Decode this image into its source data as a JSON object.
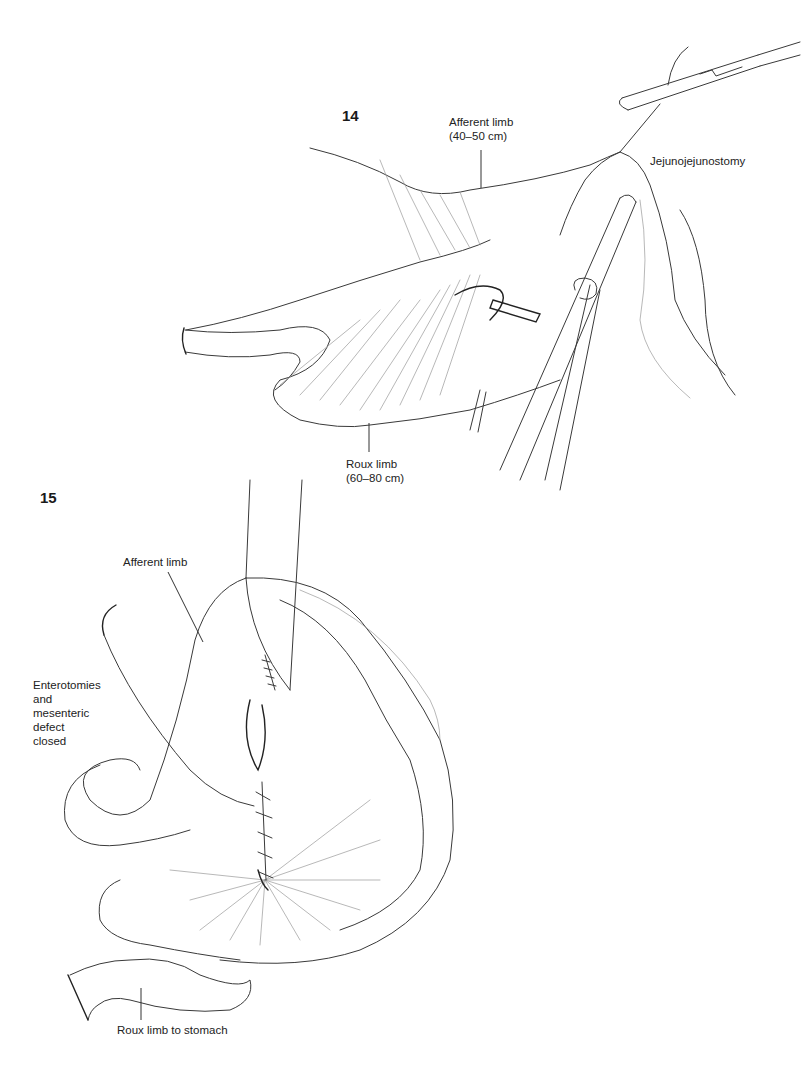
{
  "figures": [
    {
      "number": "14",
      "labels": {
        "afferent_limb": [
          "Afferent limb",
          "(40–50 cm)"
        ],
        "jejunojejunostomy": "Jejunojejunostomy",
        "roux_limb": [
          "Roux limb",
          "(60–80 cm)"
        ]
      }
    },
    {
      "number": "15",
      "labels": {
        "afferent_limb": "Afferent limb",
        "closure": [
          "Enterotomies",
          "and",
          "mesenteric",
          "defect",
          "closed"
        ],
        "roux_to_stomach": "Roux limb to stomach"
      }
    }
  ]
}
